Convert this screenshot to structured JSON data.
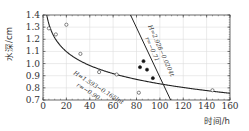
{
  "chart_data": {
    "type": "scatter",
    "title": "",
    "xlabel": "时间/h",
    "ylabel": "水深/cm",
    "xlim": [
      0,
      160
    ],
    "ylim": [
      0.7,
      1.4
    ],
    "xticks": [
      0,
      20,
      40,
      60,
      80,
      100,
      120,
      140,
      160
    ],
    "xtick_labels": [
      "0",
      "20",
      "40",
      "60",
      "80",
      "100",
      "120",
      "140",
      "160"
    ],
    "yticks": [
      0.7,
      0.8,
      0.9,
      1.0,
      1.1,
      1.2,
      1.3,
      1.4
    ],
    "ytick_labels": [
      "0.7",
      "0.8",
      "0.9",
      "1.0",
      "1.1",
      "1.2",
      "1.3",
      "1.4"
    ],
    "grid": true,
    "legend": "none",
    "series": [
      {
        "name": "hollow-points",
        "marker": "open-circle",
        "x": [
          5,
          11,
          20,
          32,
          48,
          63,
          82,
          145
        ],
        "y": [
          1.29,
          1.24,
          1.32,
          1.08,
          0.93,
          0.91,
          0.76,
          0.78
        ]
      },
      {
        "name": "filled-points",
        "marker": "filled-circle",
        "x": [
          83,
          86,
          89,
          94
        ],
        "y": [
          0.97,
          1.02,
          0.95,
          0.88
        ]
      },
      {
        "name": "log-fit",
        "type": "line",
        "equation": "H=1.593−0.165lnt",
        "a": 1.593,
        "b": -0.165,
        "form": "log"
      },
      {
        "name": "linear-fit",
        "type": "line",
        "equation": "H=2.928−0.0204t",
        "a": 2.928,
        "b": -0.0204,
        "form": "linear"
      }
    ],
    "annotations": [
      {
        "text": "H=1.593−0.165lnt",
        "near": "log-fit"
      },
      {
        "text": "r=−0.90",
        "near": "log-fit"
      },
      {
        "text": "H=2.928−0.0204t",
        "near": "linear-fit"
      },
      {
        "text": "r=−0.71",
        "near": "linear-fit"
      }
    ]
  },
  "annotations_text": {
    "log_eq": "H=1.593−0.165lnt",
    "log_r": "r=−0.90",
    "lin_eq": "H=2.928−0.0204t",
    "lin_r": "r=−0.71"
  },
  "axes": {
    "xlabel": "时间/h",
    "ylabel": "水深/cm"
  }
}
